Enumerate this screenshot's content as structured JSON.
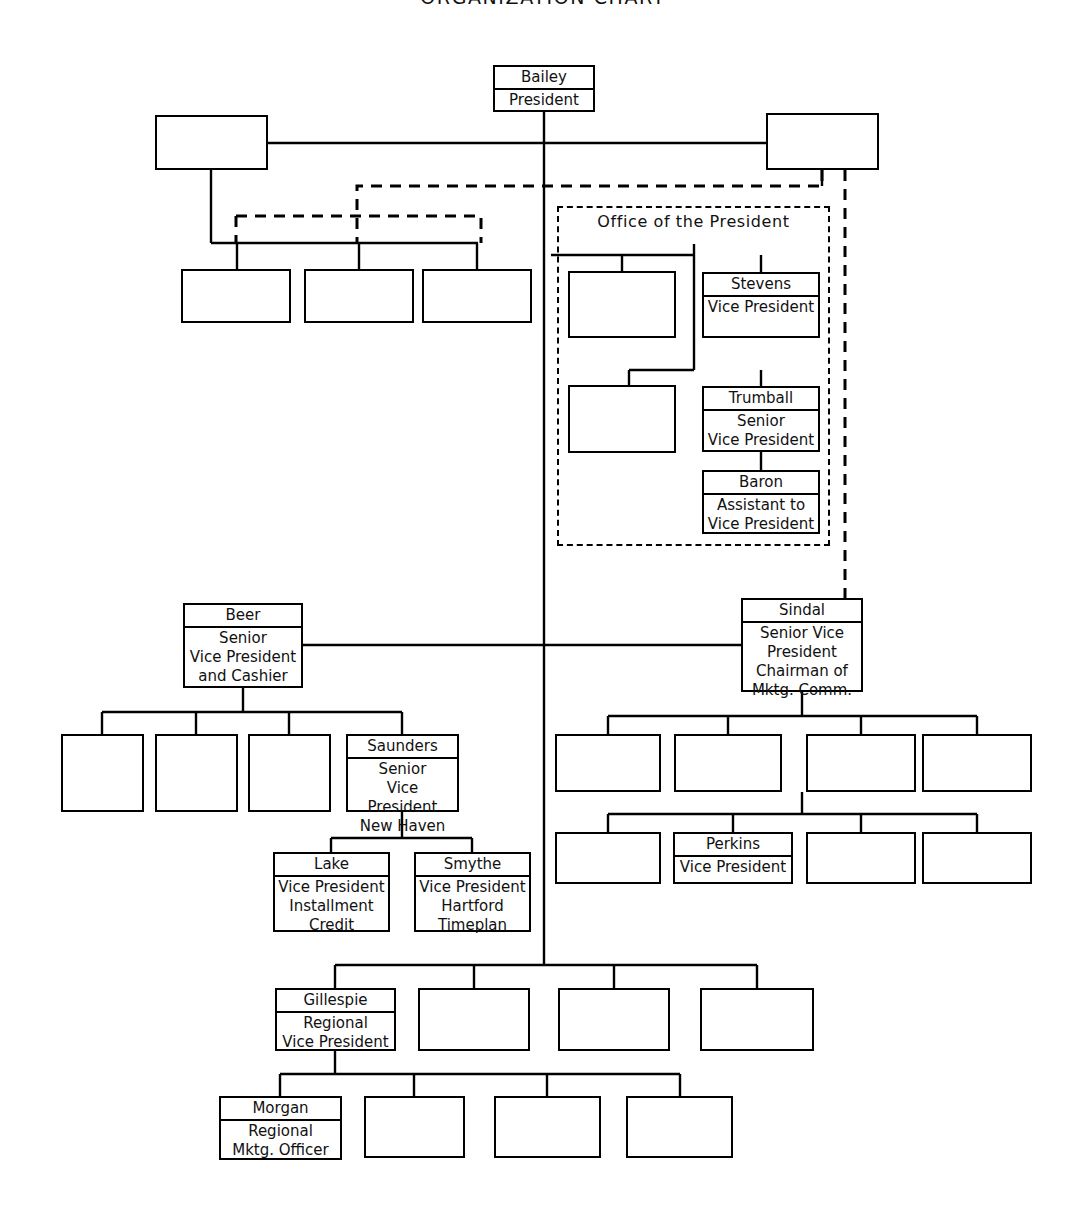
{
  "document": {
    "title": "ORGANIZATION CHART",
    "title_top": -14,
    "background_color": "#ffffff",
    "line_color": "#000000",
    "text_color": "#111111",
    "width": 1086,
    "height": 1214
  },
  "groups": [
    {
      "id": "office-of-the-president",
      "label": "Office of the President",
      "x": 557,
      "y": 206,
      "w": 273,
      "h": 340,
      "label_x": 557,
      "label_y": 212,
      "label_w": 273,
      "style": "dashed"
    }
  ],
  "nodes": [
    {
      "id": "bailey",
      "name": "Bailey",
      "title": "President",
      "x": 493,
      "y": 65,
      "w": 102,
      "h": 47,
      "filled": true
    },
    {
      "id": "top-left-blank",
      "name": "",
      "title": "",
      "x": 155,
      "y": 115,
      "w": 113,
      "h": 55,
      "filled": false
    },
    {
      "id": "top-right-blank",
      "name": "",
      "title": "",
      "x": 766,
      "y": 113,
      "w": 113,
      "h": 57,
      "filled": false
    },
    {
      "id": "left-row-blank-1",
      "name": "",
      "title": "",
      "x": 181,
      "y": 269,
      "w": 110,
      "h": 54,
      "filled": false
    },
    {
      "id": "left-row-blank-2",
      "name": "",
      "title": "",
      "x": 304,
      "y": 269,
      "w": 110,
      "h": 54,
      "filled": false
    },
    {
      "id": "left-row-blank-3",
      "name": "",
      "title": "",
      "x": 422,
      "y": 269,
      "w": 110,
      "h": 54,
      "filled": false
    },
    {
      "id": "oop-blank-1",
      "name": "",
      "title": "",
      "x": 568,
      "y": 271,
      "w": 108,
      "h": 67,
      "filled": false
    },
    {
      "id": "stevens",
      "name": "Stevens",
      "title": "Vice President",
      "x": 702,
      "y": 272,
      "w": 118,
      "h": 66,
      "filled": true
    },
    {
      "id": "oop-blank-2",
      "name": "",
      "title": "",
      "x": 568,
      "y": 385,
      "w": 108,
      "h": 68,
      "filled": false
    },
    {
      "id": "trumball",
      "name": "Trumball",
      "title": "Senior\nVice President",
      "x": 702,
      "y": 386,
      "w": 118,
      "h": 66,
      "filled": true
    },
    {
      "id": "baron",
      "name": "Baron",
      "title": "Assistant to\nVice President",
      "x": 702,
      "y": 470,
      "w": 118,
      "h": 64,
      "filled": true
    },
    {
      "id": "beer",
      "name": "Beer",
      "title": "Senior\nVice President\nand Cashier",
      "x": 183,
      "y": 603,
      "w": 120,
      "h": 85,
      "filled": true
    },
    {
      "id": "sindal",
      "name": "Sindal",
      "title": "Senior Vice\nPresident\nChairman of\nMktg. Comm.",
      "x": 741,
      "y": 598,
      "w": 122,
      "h": 94,
      "filled": true
    },
    {
      "id": "beer-blank-1",
      "name": "",
      "title": "",
      "x": 61,
      "y": 734,
      "w": 83,
      "h": 78,
      "filled": false
    },
    {
      "id": "beer-blank-2",
      "name": "",
      "title": "",
      "x": 155,
      "y": 734,
      "w": 83,
      "h": 78,
      "filled": false
    },
    {
      "id": "beer-blank-3",
      "name": "",
      "title": "",
      "x": 248,
      "y": 734,
      "w": 83,
      "h": 78,
      "filled": false
    },
    {
      "id": "saunders",
      "name": "Saunders",
      "title": "Senior\nVice President\nNew Haven",
      "x": 346,
      "y": 734,
      "w": 113,
      "h": 78,
      "filled": true
    },
    {
      "id": "lake",
      "name": "Lake",
      "title": "Vice President\nInstallment\nCredit",
      "x": 273,
      "y": 852,
      "w": 117,
      "h": 80,
      "filled": true
    },
    {
      "id": "smythe",
      "name": "Smythe",
      "title": "Vice President\nHartford\nTimeplan",
      "x": 414,
      "y": 852,
      "w": 117,
      "h": 80,
      "filled": true
    },
    {
      "id": "sindal-r1-blank-1",
      "name": "",
      "title": "",
      "x": 555,
      "y": 734,
      "w": 106,
      "h": 58,
      "filled": false
    },
    {
      "id": "sindal-r1-blank-2",
      "name": "",
      "title": "",
      "x": 674,
      "y": 734,
      "w": 108,
      "h": 58,
      "filled": false
    },
    {
      "id": "sindal-r1-blank-3",
      "name": "",
      "title": "",
      "x": 806,
      "y": 734,
      "w": 110,
      "h": 58,
      "filled": false
    },
    {
      "id": "sindal-r1-blank-4",
      "name": "",
      "title": "",
      "x": 922,
      "y": 734,
      "w": 110,
      "h": 58,
      "filled": false
    },
    {
      "id": "sindal-r2-blank-1",
      "name": "",
      "title": "",
      "x": 555,
      "y": 832,
      "w": 106,
      "h": 52,
      "filled": false
    },
    {
      "id": "perkins",
      "name": "Perkins",
      "title": "Vice President",
      "x": 673,
      "y": 832,
      "w": 120,
      "h": 52,
      "filled": true
    },
    {
      "id": "sindal-r2-blank-3",
      "name": "",
      "title": "",
      "x": 806,
      "y": 832,
      "w": 110,
      "h": 52,
      "filled": false
    },
    {
      "id": "sindal-r2-blank-4",
      "name": "",
      "title": "",
      "x": 922,
      "y": 832,
      "w": 110,
      "h": 52,
      "filled": false
    },
    {
      "id": "gillespie",
      "name": "Gillespie",
      "title": "Regional\nVice President",
      "x": 275,
      "y": 988,
      "w": 121,
      "h": 63,
      "filled": true
    },
    {
      "id": "gill-row-blank-1",
      "name": "",
      "title": "",
      "x": 418,
      "y": 988,
      "w": 112,
      "h": 63,
      "filled": false
    },
    {
      "id": "gill-row-blank-2",
      "name": "",
      "title": "",
      "x": 558,
      "y": 988,
      "w": 112,
      "h": 63,
      "filled": false
    },
    {
      "id": "gill-row-blank-3",
      "name": "",
      "title": "",
      "x": 700,
      "y": 988,
      "w": 114,
      "h": 63,
      "filled": false
    },
    {
      "id": "morgan",
      "name": "Morgan",
      "title": "Regional\nMktg. Officer",
      "x": 219,
      "y": 1096,
      "w": 123,
      "h": 64,
      "filled": true
    },
    {
      "id": "morgan-row-blank-1",
      "name": "",
      "title": "",
      "x": 364,
      "y": 1096,
      "w": 101,
      "h": 62,
      "filled": false
    },
    {
      "id": "morgan-row-blank-2",
      "name": "",
      "title": "",
      "x": 494,
      "y": 1096,
      "w": 107,
      "h": 62,
      "filled": false
    },
    {
      "id": "morgan-row-blank-3",
      "name": "",
      "title": "",
      "x": 626,
      "y": 1096,
      "w": 107,
      "h": 62,
      "filled": false
    }
  ],
  "connectors": {
    "solid": [
      "M544,112 L544,965",
      "M268,143 L766,143",
      "M211,170 L211,243",
      "M211,243 L478,243",
      "M237,243 L237,269",
      "M359,243 L359,269",
      "M477,243 L477,269",
      "M822,170 L822,186",
      "M551,255 L694,255",
      "M622,255 L622,271",
      "M694,244 L694,370",
      "M761,255 L761,272",
      "M629,370 L694,370",
      "M629,370 L629,385",
      "M761,370 L761,386",
      "M761,452 L761,470",
      "M303,645 L741,645",
      "M243,688 L243,712",
      "M102,712 L402,712",
      "M102,712 L102,734",
      "M196,712 L196,734",
      "M289,712 L289,734",
      "M402,712 L402,734",
      "M402,812 L402,838",
      "M331,838 L472,838",
      "M331,838 L331,852",
      "M472,838 L472,852",
      "M802,692 L802,716",
      "M608,716 L977,716",
      "M608,716 L608,734",
      "M728,716 L728,734",
      "M861,716 L861,734",
      "M977,716 L977,734",
      "M802,792 L802,814",
      "M608,814 L977,814",
      "M608,814 L608,832",
      "M733,814 L733,832",
      "M861,814 L861,832",
      "M977,814 L977,832",
      "M335,965 L757,965",
      "M335,965 L335,988",
      "M474,965 L474,988",
      "M614,965 L614,988",
      "M757,965 L757,988",
      "M335,1051 L335,1074",
      "M280,1074 L680,1074",
      "M280,1074 L280,1096",
      "M414,1074 L414,1096",
      "M547,1074 L547,1096",
      "M680,1074 L680,1096"
    ],
    "dashed": [
      "M822,170 L822,186 L357,186 L357,243",
      "M236,216 L481,216 L481,243",
      "M236,216 L236,243",
      "M845,170 L845,598"
    ]
  }
}
